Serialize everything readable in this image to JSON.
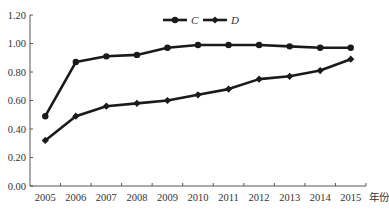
{
  "chart_data": {
    "type": "line",
    "title": "",
    "xlabel": "年份",
    "ylabel": "",
    "categories": [
      "2005",
      "2006",
      "2007",
      "2008",
      "2009",
      "2010",
      "2011",
      "2012",
      "2013",
      "2014",
      "2015"
    ],
    "series": [
      {
        "name": "C",
        "marker": "circle",
        "values": [
          0.49,
          0.87,
          0.91,
          0.92,
          0.97,
          0.99,
          0.99,
          0.99,
          0.98,
          0.97,
          0.97
        ]
      },
      {
        "name": "D",
        "marker": "diamond",
        "values": [
          0.32,
          0.49,
          0.56,
          0.58,
          0.6,
          0.64,
          0.68,
          0.75,
          0.77,
          0.81,
          0.89
        ]
      }
    ],
    "ylim": [
      0,
      1.2
    ],
    "yticks": [
      "0.00",
      "0.20",
      "0.40",
      "0.60",
      "0.80",
      "1.00",
      "1.20"
    ],
    "grid": false,
    "legend_position": "top-center",
    "colors": {
      "line": "#1a1a1a",
      "axis": "#555555",
      "text": "#333333"
    }
  }
}
